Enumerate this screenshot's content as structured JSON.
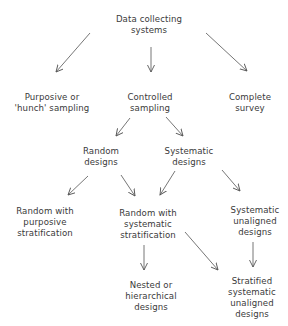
{
  "diagram": {
    "type": "hierarchy-flowchart",
    "nodes": {
      "root": {
        "label": "Data collecting\nsystems"
      },
      "purposive": {
        "label": "Purposive or\n'hunch' sampling"
      },
      "controlled": {
        "label": "Controlled\nsampling"
      },
      "complete": {
        "label": "Complete\nsurvey"
      },
      "random": {
        "label": "Random\ndesigns"
      },
      "systematic": {
        "label": "Systematic\ndesigns"
      },
      "random_purposive": {
        "label": "Random with\npurposive\nstratification"
      },
      "random_systematic": {
        "label": "Random with\nsystematic\nstratification"
      },
      "systematic_unaligned": {
        "label": "Systematic\nunaligned\ndesigns"
      },
      "nested": {
        "label": "Nested or\nhierarchical\ndesigns"
      },
      "stratified_unaligned": {
        "label": "Stratified\nsystematic\nunaligned\ndesigns"
      }
    },
    "edges": [
      {
        "from": "root",
        "to": "purposive"
      },
      {
        "from": "root",
        "to": "controlled"
      },
      {
        "from": "root",
        "to": "complete"
      },
      {
        "from": "controlled",
        "to": "random"
      },
      {
        "from": "controlled",
        "to": "systematic"
      },
      {
        "from": "random",
        "to": "random_purposive"
      },
      {
        "from": "random",
        "to": "random_systematic"
      },
      {
        "from": "systematic",
        "to": "random_systematic"
      },
      {
        "from": "systematic",
        "to": "systematic_unaligned"
      },
      {
        "from": "random_systematic",
        "to": "nested"
      },
      {
        "from": "random_systematic",
        "to": "stratified_unaligned"
      },
      {
        "from": "systematic_unaligned",
        "to": "stratified_unaligned"
      }
    ],
    "line_color": "#555555",
    "text_color": "#3a3a3a"
  }
}
